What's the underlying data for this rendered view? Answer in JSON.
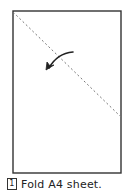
{
  "diagram": {
    "type": "origami-step",
    "sheet": {
      "shape": "rectangle",
      "x1": 13,
      "y1": 11,
      "x2": 121,
      "y2": 173,
      "stroke": "#333333"
    },
    "fold_line": {
      "style": "dashed",
      "from": [
        13,
        12
      ],
      "to": [
        121,
        117
      ],
      "stroke": "#777777"
    },
    "arrow": {
      "direction": "fold-down-left",
      "tail": [
        73,
        52
      ],
      "head": [
        48,
        69
      ],
      "stroke": "#222222"
    }
  },
  "caption": {
    "step_number": "1",
    "text": "Fold A4 sheet."
  }
}
